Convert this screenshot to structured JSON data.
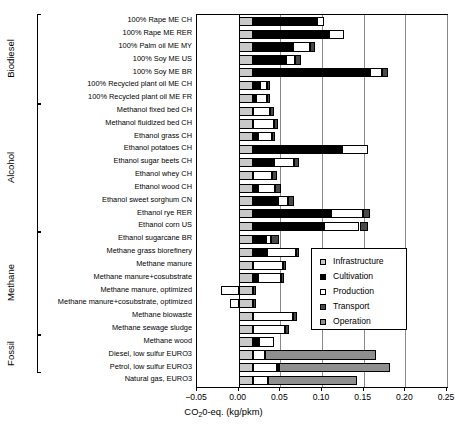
{
  "chart_data": {
    "type": "bar",
    "orientation": "horizontal",
    "stacked": true,
    "title": "",
    "xlabel": "CO²0-eq. (kg/pkm)",
    "xlabel_parts": {
      "pre": "CO",
      "sub": "2",
      "post": "0-eq. (kg/pkm)"
    },
    "ylabel": "",
    "xlim": [
      -0.05,
      0.25
    ],
    "xticks": [
      -0.05,
      0.0,
      0.05,
      0.1,
      0.15,
      0.2,
      0.25
    ],
    "xticklabels": [
      "-0.05",
      "0.00",
      "0.05",
      "0.10",
      "0.15",
      "0.20",
      "0.25"
    ],
    "grid": "vertical",
    "legend_position": "center-right-inside",
    "series": [
      {
        "name": "Infrastructure",
        "color": "#c9c9c9"
      },
      {
        "name": "Cultivation",
        "color": "#000000"
      },
      {
        "name": "Production",
        "color": "#ffffff"
      },
      {
        "name": "Transport",
        "color": "#4a4a4a"
      },
      {
        "name": "Operation",
        "color": "#8f8f8f"
      }
    ],
    "groups": [
      {
        "label": "Biodiesel",
        "count": 7
      },
      {
        "label": "Alcohol",
        "count": 10
      },
      {
        "label": "Methane",
        "count": 8
      },
      {
        "label": "Fossil",
        "count": 3
      }
    ],
    "categories": [
      "100% Rape ME CH",
      "100% Rape ME RER",
      "100% Palm oil ME MY",
      "100% Soy ME US",
      "100% Soy ME BR",
      "100% Recycled plant oil ME CH",
      "100% Recycled plant oil ME FR",
      "Methanol fixed bed CH",
      "Methanol fluidized bed CH",
      "Ethanol grass CH",
      "Ethanol potatoes CH",
      "Ethanol sugar beets CH",
      "Ethanol whey CH",
      "Ethanol wood CH",
      "Ethanol sweet sorghum CN",
      "Ethanol rye RER",
      "Ethanol corn US",
      "Ethanol sugarcane BR",
      "Methane grass biorefinery",
      "Methane manure",
      "Methane manure+cosubstrate",
      "Methane manure, optimized",
      "Methane manure+cosubstrate, optimized",
      "Methane biowaste",
      "Methane sewage sludge",
      "Methane wood",
      "Diesel, low sulfur EURO3",
      "Petrol, low sulfur EURO3",
      "Natural gas, EURO3"
    ],
    "stacks": [
      {
        "category": "100% Rape ME CH",
        "Infrastructure": 0.0175,
        "Cultivation": 0.076,
        "Production": 0.0085,
        "Transport": 0.0,
        "Operation": 0.0
      },
      {
        "category": "100% Rape ME RER",
        "Infrastructure": 0.0175,
        "Cultivation": 0.0905,
        "Production": 0.019,
        "Transport": 0.0,
        "Operation": 0.0
      },
      {
        "category": "100% Palm oil ME MY",
        "Infrastructure": 0.0175,
        "Cultivation": 0.0475,
        "Production": 0.0205,
        "Transport": 0.006,
        "Operation": 0.0
      },
      {
        "category": "100% Soy ME US",
        "Infrastructure": 0.0175,
        "Cultivation": 0.039,
        "Production": 0.0115,
        "Transport": 0.007,
        "Operation": 0.0
      },
      {
        "category": "100% Soy ME BR",
        "Infrastructure": 0.0175,
        "Cultivation": 0.1395,
        "Production": 0.0155,
        "Transport": 0.007,
        "Operation": 0.0
      },
      {
        "category": "100% Recycled plant oil ME CH",
        "Infrastructure": 0.0175,
        "Cultivation": 0.008,
        "Production": 0.0085,
        "Transport": 0.003,
        "Operation": 0.0
      },
      {
        "category": "100% Recycled plant oil ME FR",
        "Infrastructure": 0.0175,
        "Cultivation": 0.003,
        "Production": 0.0135,
        "Transport": 0.003,
        "Operation": 0.0
      },
      {
        "category": "Methanol fixed bed CH",
        "Infrastructure": 0.0175,
        "Cultivation": 0.0,
        "Production": 0.0195,
        "Transport": 0.005,
        "Operation": 0.0
      },
      {
        "category": "Methanol fluidized bed CH",
        "Infrastructure": 0.0175,
        "Cultivation": 0.0,
        "Production": 0.025,
        "Transport": 0.005,
        "Operation": 0.0
      },
      {
        "category": "Ethanol grass CH",
        "Infrastructure": 0.0175,
        "Cultivation": 0.0055,
        "Production": 0.0175,
        "Transport": 0.0035,
        "Operation": 0.0
      },
      {
        "category": "Ethanol potatoes CH",
        "Infrastructure": 0.0175,
        "Cultivation": 0.107,
        "Production": 0.031,
        "Transport": 0.0,
        "Operation": 0.0
      },
      {
        "category": "Ethanol sugar beets CH",
        "Infrastructure": 0.0175,
        "Cultivation": 0.0245,
        "Production": 0.0245,
        "Transport": 0.0055,
        "Operation": 0.0
      },
      {
        "category": "Ethanol whey CH",
        "Infrastructure": 0.0175,
        "Cultivation": 0.0,
        "Production": 0.0225,
        "Transport": 0.0055,
        "Operation": 0.0
      },
      {
        "category": "Ethanol wood CH",
        "Infrastructure": 0.0175,
        "Cultivation": 0.006,
        "Production": 0.0205,
        "Transport": 0.0065,
        "Operation": 0.0
      },
      {
        "category": "Ethanol sweet sorghum CN",
        "Infrastructure": 0.0175,
        "Cultivation": 0.0295,
        "Production": 0.012,
        "Transport": 0.007,
        "Operation": 0.0
      },
      {
        "category": "Ethanol rye RER",
        "Infrastructure": 0.0175,
        "Cultivation": 0.093,
        "Production": 0.039,
        "Transport": 0.0085,
        "Operation": 0.0
      },
      {
        "category": "Ethanol corn US",
        "Infrastructure": 0.0175,
        "Cultivation": 0.0845,
        "Production": 0.043,
        "Transport": 0.0105,
        "Operation": 0.0
      },
      {
        "category": "Ethanol sugarcane BR",
        "Infrastructure": 0.0175,
        "Cultivation": 0.0155,
        "Production": 0.006,
        "Transport": 0.009,
        "Operation": 0.0
      },
      {
        "category": "Methane grass biorefinery",
        "Infrastructure": 0.0175,
        "Cultivation": 0.0165,
        "Production": 0.035,
        "Transport": 0.004,
        "Operation": 0.0
      },
      {
        "category": "Methane manure",
        "Infrastructure": 0.0175,
        "Cultivation": 0.0,
        "Production": 0.036,
        "Transport": 0.0035,
        "Operation": 0.0
      },
      {
        "category": "Methane manure+cosubstrate",
        "Infrastructure": 0.0175,
        "Cultivation": 0.006,
        "Production": 0.027,
        "Transport": 0.0035,
        "Operation": 0.0
      },
      {
        "category": "Methane manure, optimized",
        "Infrastructure": 0.0175,
        "Cultivation": 0.0,
        "Production": -0.0215,
        "Transport": 0.0035,
        "Operation": 0.0
      },
      {
        "category": "Methane manure+cosubstrate, optimized",
        "Infrastructure": 0.0175,
        "Cultivation": 0.0,
        "Production": -0.0105,
        "Transport": 0.0035,
        "Operation": 0.0
      },
      {
        "category": "Methane biowaste",
        "Infrastructure": 0.0175,
        "Cultivation": 0.0,
        "Production": 0.0475,
        "Transport": 0.0045,
        "Operation": 0.0
      },
      {
        "category": "Methane sewage sludge",
        "Infrastructure": 0.0175,
        "Cultivation": 0.0,
        "Production": 0.0385,
        "Transport": 0.004,
        "Operation": 0.0
      },
      {
        "category": "Methane wood",
        "Infrastructure": 0.0175,
        "Cultivation": 0.007,
        "Production": 0.0185,
        "Transport": 0.0,
        "Operation": 0.0
      },
      {
        "category": "Diesel, low sulfur EURO3",
        "Infrastructure": 0.0175,
        "Cultivation": 0.0,
        "Production": 0.0135,
        "Transport": 0.0,
        "Operation": 0.1335
      },
      {
        "category": "Petrol, low sulfur EURO3",
        "Infrastructure": 0.0175,
        "Cultivation": 0.0,
        "Production": 0.0285,
        "Transport": 0.0025,
        "Operation": 0.133
      },
      {
        "category": "Natural gas, EURO3",
        "Infrastructure": 0.0175,
        "Cultivation": 0.0,
        "Production": 0.0175,
        "Transport": 0.0,
        "Operation": 0.1065
      }
    ]
  }
}
